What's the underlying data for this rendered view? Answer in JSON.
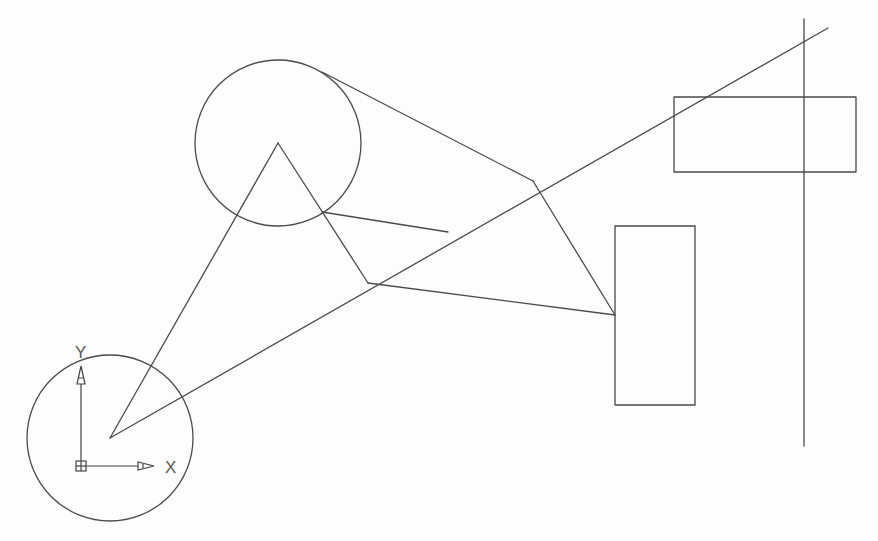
{
  "drawing": {
    "stroke_color": "#4a4a4a",
    "background_color": "#fdfdfd",
    "circles": [
      {
        "id": "circle-top",
        "cx": 278,
        "cy": 143,
        "r": 83
      },
      {
        "id": "circle-origin",
        "cx": 110,
        "cy": 438,
        "r": 83
      }
    ],
    "rectangles": [
      {
        "id": "rect-tall",
        "x": 615,
        "y": 226,
        "w": 80,
        "h": 179
      },
      {
        "id": "rect-wide",
        "x": 674,
        "y": 97,
        "w": 182,
        "h": 75
      }
    ],
    "lines": [
      {
        "id": "triangle-left-leg",
        "x1": 278,
        "y1": 143,
        "x2": 110,
        "y2": 438
      },
      {
        "id": "triangle-right-leg",
        "x1": 278,
        "y1": 143,
        "x2": 368,
        "y2": 283
      },
      {
        "id": "long-diagonal",
        "x1": 110,
        "y1": 438,
        "x2": 828,
        "y2": 28
      },
      {
        "id": "tangent-to-vertex",
        "x1": 322,
        "y1": 72,
        "x2": 533,
        "y2": 181
      },
      {
        "id": "circle-to-diagonal",
        "x1": 322,
        "y1": 212,
        "x2": 448,
        "y2": 232
      },
      {
        "id": "vertex-to-rect",
        "x1": 533,
        "y1": 181,
        "x2": 615,
        "y2": 315
      },
      {
        "id": "apex-to-rect",
        "x1": 368,
        "y1": 283,
        "x2": 615,
        "y2": 315
      },
      {
        "id": "vertical-construction-line",
        "x1": 804,
        "y1": 19,
        "x2": 804,
        "y2": 446
      }
    ],
    "ucs_icon": {
      "origin_x": 81,
      "origin_y": 466,
      "x_label": "X",
      "y_label": "Y"
    }
  }
}
